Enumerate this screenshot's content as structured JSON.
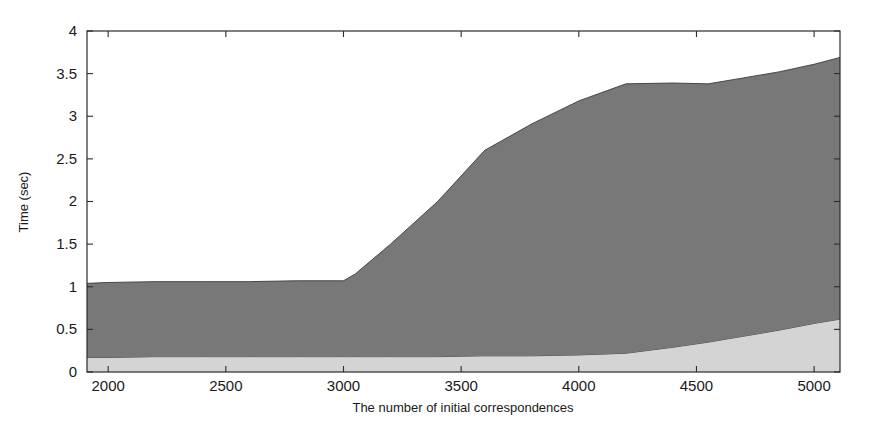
{
  "figure": {
    "width": 875,
    "height": 433,
    "background": "#ffffff"
  },
  "chart_data": {
    "type": "area",
    "stacked": true,
    "title": "",
    "xlabel": "The number of initial correspondences",
    "ylabel": "Time (sec)",
    "xlim": [
      1910,
      5110
    ],
    "ylim": [
      0,
      4
    ],
    "xticks": [
      2000,
      2500,
      3000,
      3500,
      4000,
      4500,
      5000
    ],
    "xticklabels": [
      "2000",
      "2500",
      "3000",
      "3500",
      "4000",
      "4500",
      "5000"
    ],
    "yticks": [
      0,
      0.5,
      1,
      1.5,
      2,
      2.5,
      3,
      3.5,
      4
    ],
    "yticklabels": [
      "0",
      "0.5",
      "1",
      "1.5",
      "2",
      "2.5",
      "3",
      "3.5",
      "4"
    ],
    "grid": false,
    "legend": "none",
    "x": [
      1910,
      2000,
      2200,
      2400,
      2600,
      2800,
      3000,
      3050,
      3200,
      3400,
      3600,
      3800,
      4000,
      4200,
      4400,
      4550,
      4700,
      4850,
      5000,
      5110
    ],
    "series": [
      {
        "name": "lower-band",
        "color": "#d4d4d4",
        "values": [
          0.17,
          0.17,
          0.18,
          0.18,
          0.18,
          0.18,
          0.18,
          0.18,
          0.18,
          0.18,
          0.19,
          0.19,
          0.2,
          0.22,
          0.29,
          0.35,
          0.42,
          0.49,
          0.57,
          0.62
        ]
      },
      {
        "name": "upper-band",
        "color": "#787878",
        "values": [
          0.87,
          0.88,
          0.88,
          0.88,
          0.88,
          0.89,
          0.89,
          0.97,
          1.32,
          1.82,
          2.41,
          2.72,
          2.98,
          3.16,
          3.1,
          3.03,
          3.03,
          3.03,
          3.04,
          3.07
        ]
      }
    ],
    "cumulative_top": [
      1.04,
      1.05,
      1.06,
      1.06,
      1.06,
      1.07,
      1.07,
      1.15,
      1.5,
      2.0,
      2.6,
      2.91,
      3.18,
      3.38,
      3.39,
      3.38,
      3.45,
      3.52,
      3.61,
      3.69
    ]
  }
}
